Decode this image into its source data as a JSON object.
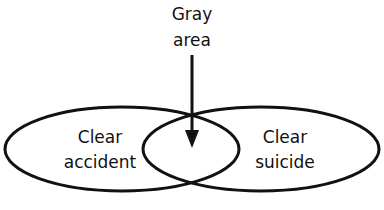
{
  "diagram": {
    "top_label": {
      "line1": "Gray",
      "line2": "area"
    },
    "left_set": {
      "line1": "Clear",
      "line2": "accident"
    },
    "right_set": {
      "line1": "Clear",
      "line2": "suicide"
    },
    "colors": {
      "stroke": "#111111",
      "background": "#ffffff"
    }
  }
}
